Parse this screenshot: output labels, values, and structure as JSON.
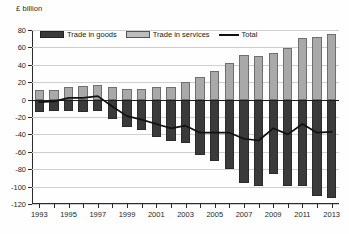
{
  "axis_unit_label": "£ billion",
  "legend": {
    "items": [
      {
        "key": "goods",
        "label": "Trade in goods",
        "color": "#3a3a3a",
        "marker": "filled-dark-bar"
      },
      {
        "key": "services",
        "label": "Trade in services",
        "color": "#bdbdbd",
        "marker": "filled-light-bar"
      },
      {
        "key": "total",
        "label": "Total",
        "color": "#111111",
        "marker": "solid-line"
      }
    ]
  },
  "chart_data": {
    "type": "bar",
    "title": "",
    "subtitle": "",
    "xlabel": "",
    "ylabel": "£ billion",
    "ylim": [
      -120,
      80
    ],
    "ytick_step": 20,
    "yticks": [
      80,
      60,
      40,
      20,
      0,
      -20,
      -40,
      -60,
      -80,
      -100,
      -120
    ],
    "ytick_labels": [
      "80",
      "60",
      "40",
      "20",
      "0",
      "-20",
      "-40",
      "-60",
      "-80",
      "-100",
      "-120"
    ],
    "grid": true,
    "legend_position": "top-inside",
    "stacked": false,
    "zero_line": 0,
    "categories": [
      "1993",
      "1994",
      "1995",
      "1996",
      "1997",
      "1998",
      "1999",
      "2000",
      "2001",
      "2002",
      "2003",
      "2004",
      "2005",
      "2006",
      "2007",
      "2008",
      "2009",
      "2010",
      "2011",
      "2012",
      "2013"
    ],
    "xtick_labels": [
      "1993",
      "1995",
      "1997",
      "1999",
      "2001",
      "2003",
      "2005",
      "2007",
      "2009",
      "2011",
      "2013"
    ],
    "series": [
      {
        "name": "Trade in services",
        "type": "bar",
        "color": "#bdbdbd",
        "values": [
          11,
          11,
          15,
          16,
          17,
          14,
          12,
          12,
          15,
          15,
          20,
          26,
          33,
          42,
          51,
          50,
          54,
          59,
          71,
          72,
          75
        ]
      },
      {
        "name": "Trade in goods",
        "type": "bar",
        "color": "#3a3a3a",
        "values": [
          -14,
          -13,
          -13,
          -14,
          -13,
          -22,
          -31,
          -35,
          -43,
          -48,
          -50,
          -64,
          -71,
          -80,
          -96,
          -99,
          -86,
          -99,
          -99,
          -111,
          -113
        ]
      },
      {
        "name": "Total",
        "type": "line",
        "color": "#111111",
        "values": [
          -3,
          -2,
          2,
          2,
          4,
          -8,
          -19,
          -23,
          -28,
          -33,
          -30,
          -38,
          -38,
          -38,
          -45,
          -47,
          -33,
          -40,
          -28,
          -38,
          -37
        ]
      }
    ]
  }
}
